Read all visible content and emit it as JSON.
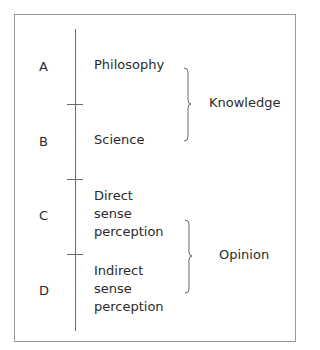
{
  "diagram": {
    "segments": [
      {
        "letter": "A",
        "label_lines": [
          "Philosophy"
        ]
      },
      {
        "letter": "B",
        "label_lines": [
          "Science"
        ]
      },
      {
        "letter": "C",
        "label_lines": [
          "Direct",
          "sense",
          "perception"
        ]
      },
      {
        "letter": "D",
        "label_lines": [
          "Indirect",
          "sense",
          "perception"
        ]
      }
    ],
    "groups": [
      {
        "label": "Knowledge",
        "covers": [
          "A",
          "B"
        ]
      },
      {
        "label": "Opinion",
        "covers": [
          "C",
          "D"
        ]
      }
    ]
  }
}
